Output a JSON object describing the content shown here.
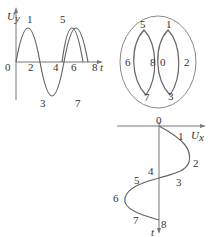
{
  "figure_a": {
    "y_axis_label": "U",
    "y_axis_sub": "y",
    "x_axis_label": "t",
    "origin_label": "0",
    "tick_labels_on_axis": [
      "2",
      "4",
      "6",
      "8"
    ],
    "peak_labels": [
      "1",
      "5"
    ],
    "trough_labels": [
      "3",
      "7"
    ]
  },
  "figure_b": {
    "labels": [
      "5",
      "1",
      "6",
      "8",
      "0",
      "2",
      "7",
      "3"
    ]
  },
  "figure_c": {
    "x_axis_label": "U",
    "x_axis_sub": "x",
    "t_axis_label": "t",
    "point_labels": [
      "0",
      "1",
      "2",
      "3",
      "4",
      "5",
      "6",
      "7",
      "8"
    ]
  }
}
